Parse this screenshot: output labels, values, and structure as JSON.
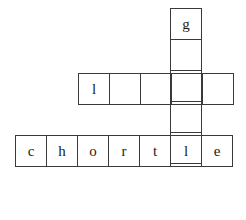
{
  "puzzle": {
    "type": "crossword-grid",
    "background_color": "#ffffff",
    "line_color": "#3a3a3a",
    "text_color": "#1a1a1a",
    "cell_size_px": 32,
    "words": [
      {
        "name": "vertical-word",
        "orientation": "vertical",
        "left_px": 170,
        "top_px": 8,
        "cells": [
          {
            "letter": "g"
          },
          {
            "letter": ""
          },
          {
            "letter": ""
          },
          {
            "letter": ""
          },
          {
            "letter": ""
          }
        ]
      },
      {
        "name": "middle-horizontal-word",
        "orientation": "horizontal",
        "left_px": 78,
        "top_px": 73,
        "cells": [
          {
            "letter": "l"
          },
          {
            "letter": ""
          },
          {
            "letter": ""
          },
          {
            "letter": ""
          },
          {
            "letter": ""
          }
        ]
      },
      {
        "name": "bottom-horizontal-word",
        "orientation": "horizontal",
        "left_px": 15,
        "top_px": 135,
        "cells": [
          {
            "letter": "c"
          },
          {
            "letter": "h"
          },
          {
            "letter": "o"
          },
          {
            "letter": "r"
          },
          {
            "letter": "t"
          },
          {
            "letter": "l"
          },
          {
            "letter": "e"
          }
        ]
      }
    ]
  }
}
